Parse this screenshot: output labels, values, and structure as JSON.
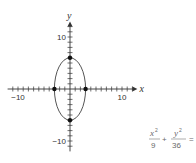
{
  "chart_data": {
    "type": "line",
    "title": "",
    "curve": "ellipse",
    "equation": {
      "term1_numerator": "x",
      "term1_exponent": "2",
      "term1_denominator": "9",
      "operator": "+",
      "term2_numerator": "y",
      "term2_exponent": "2",
      "term2_denominator": "36",
      "trailing": "="
    },
    "center": [
      0,
      0
    ],
    "semi_axis_x": 3,
    "semi_axis_y": 6,
    "points": [
      {
        "x": -3,
        "y": 0
      },
      {
        "x": 3,
        "y": 0
      },
      {
        "x": 0,
        "y": 6
      },
      {
        "x": 0,
        "y": -6
      }
    ],
    "xlabel": "x",
    "ylabel": "y",
    "xlim": [
      -12,
      12
    ],
    "ylim": [
      -12,
      12
    ],
    "x_tick_labels": [
      {
        "value": -10,
        "text": "−10"
      },
      {
        "value": 10,
        "text": "10"
      }
    ],
    "y_tick_labels": [
      {
        "value": 10,
        "text": "10"
      },
      {
        "value": -10,
        "text": "−10"
      }
    ],
    "tick_step": 1,
    "grid": false,
    "colors": {
      "axis": "#333333",
      "curve": "#555555",
      "point": "#111111"
    }
  }
}
